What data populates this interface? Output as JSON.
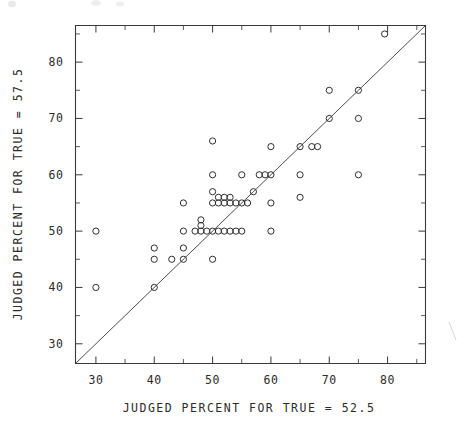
{
  "chart_data": {
    "type": "scatter",
    "title": "",
    "xlabel": "JUDGED PERCENT FOR TRUE = 52.5",
    "ylabel": "JUDGED PERCENT FOR TRUE = 57.5",
    "xlim": [
      26.5,
      86.5
    ],
    "ylim": [
      26.5,
      86.5
    ],
    "xticks": [
      30,
      40,
      50,
      60,
      70,
      80
    ],
    "yticks": [
      30,
      40,
      50,
      60,
      70,
      80
    ],
    "xtick_labels": [
      "30",
      "40",
      "50",
      "60",
      "70",
      "80"
    ],
    "ytick_labels": [
      "30",
      "40",
      "50",
      "60",
      "70",
      "80"
    ],
    "xminor_step": 5,
    "yminor_step": 5,
    "grid": false,
    "legend": null,
    "marker": "open-circle",
    "reference_line": {
      "type": "identity",
      "label": "y = x",
      "from": [
        26.5,
        26.5
      ],
      "to": [
        86.5,
        86.5
      ]
    },
    "points": [
      [
        30,
        50
      ],
      [
        30,
        40
      ],
      [
        40,
        47
      ],
      [
        40,
        45
      ],
      [
        40,
        40
      ],
      [
        43,
        45
      ],
      [
        45,
        55
      ],
      [
        45,
        50
      ],
      [
        45,
        47
      ],
      [
        45,
        45
      ],
      [
        47,
        50
      ],
      [
        48,
        52
      ],
      [
        48,
        51
      ],
      [
        48,
        50
      ],
      [
        49,
        50
      ],
      [
        50,
        66
      ],
      [
        50,
        60
      ],
      [
        50,
        57
      ],
      [
        50,
        55
      ],
      [
        50,
        50
      ],
      [
        50,
        45
      ],
      [
        51,
        56
      ],
      [
        51,
        55
      ],
      [
        51,
        50
      ],
      [
        52,
        56
      ],
      [
        52,
        55
      ],
      [
        52,
        50
      ],
      [
        53,
        56
      ],
      [
        53,
        55
      ],
      [
        53,
        50
      ],
      [
        54,
        55
      ],
      [
        54,
        50
      ],
      [
        55,
        60
      ],
      [
        55,
        55
      ],
      [
        55,
        50
      ],
      [
        56,
        55
      ],
      [
        57,
        57
      ],
      [
        58,
        60
      ],
      [
        59,
        60
      ],
      [
        60,
        65
      ],
      [
        60,
        60
      ],
      [
        60,
        55
      ],
      [
        60,
        50
      ],
      [
        65,
        65
      ],
      [
        65,
        60
      ],
      [
        65,
        56
      ],
      [
        67,
        65
      ],
      [
        68,
        65
      ],
      [
        70,
        75
      ],
      [
        70,
        70
      ],
      [
        75,
        75
      ],
      [
        75,
        70
      ],
      [
        75,
        60
      ],
      [
        79.5,
        85
      ]
    ],
    "n_points": 54
  },
  "figure": {
    "background": "#ffffff",
    "ink_color": "#2e2e2e",
    "axis_color": "#3a3a3a"
  }
}
